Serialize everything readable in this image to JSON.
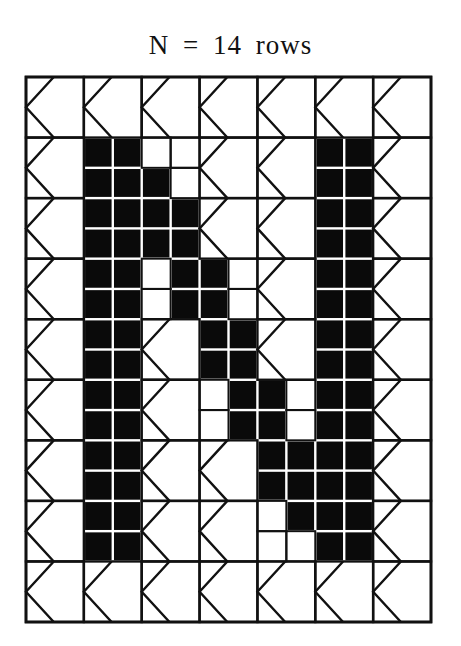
{
  "title": "N = 14 rows",
  "colors": {
    "ink": "#111111",
    "fill": "#0a0a0a",
    "background": "#ffffff"
  },
  "grid": {
    "left": 26,
    "top": 77,
    "right": 431,
    "bottom": 622,
    "columns": 7,
    "rows": 9,
    "legend": {
      "K": "chevron motif cell",
      "S": "split cell of 2x2 small squares, each B (black) or W (white)"
    },
    "cells": [
      [
        "K",
        "K",
        "K",
        "K",
        "K",
        "K",
        "K"
      ],
      [
        "K",
        "BB/BB",
        "WW/BW",
        "K",
        "K",
        "BB/BB",
        "K"
      ],
      [
        "K",
        "BB/BB",
        "BB/BB",
        "K",
        "K",
        "BB/BB",
        "K"
      ],
      [
        "K",
        "BB/BB",
        "WB/WB",
        "BW/BW",
        "K",
        "BB/BB",
        "K"
      ],
      [
        "K",
        "BB/BB",
        "K",
        "BB/BB",
        "K",
        "BB/BB",
        "K"
      ],
      [
        "K",
        "BB/BB",
        "K",
        "WB/WB",
        "BW/BW",
        "BB/BB",
        "K"
      ],
      [
        "K",
        "BB/BB",
        "K",
        "K",
        "BB/BB",
        "BB/BB",
        "K"
      ],
      [
        "K",
        "BB/BB",
        "K",
        "K",
        "WB/WW",
        "BB/BB",
        "K"
      ],
      [
        "K",
        "K",
        "K",
        "K",
        "K",
        "K",
        "K"
      ]
    ]
  }
}
